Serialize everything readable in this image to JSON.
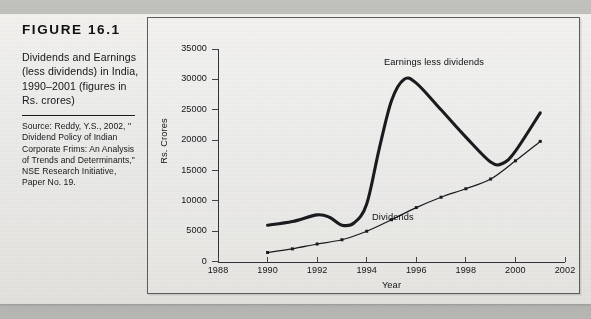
{
  "figure": {
    "label": "FIGURE  16.1",
    "title": "Dividends and Earnings (less dividends) in India, 1990–2001 (figures in Rs. crores)",
    "source": "Source: Reddy, Y.S., 2002, \" Dividend Policy of Indian Corporate Frims: An Analysis of Trends and Determinants,\" NSE Research Initiative, Paper No. 19."
  },
  "chart_data": {
    "type": "line",
    "title": "",
    "xlabel": "Year",
    "ylabel": "Rs. Crores",
    "xlim": [
      1988,
      2002
    ],
    "ylim": [
      0,
      35000
    ],
    "xticks": [
      1988,
      1990,
      1992,
      1994,
      1996,
      1998,
      2000,
      2002
    ],
    "yticks": [
      0,
      5000,
      10000,
      15000,
      20000,
      25000,
      30000,
      35000
    ],
    "grid": false,
    "legend": "inline-annotations",
    "series": [
      {
        "name": "Earnings less dividends",
        "style": "thick-line",
        "markers": false,
        "x": [
          1990,
          1991,
          1992,
          1992.5,
          1993,
          1993.5,
          1994,
          1994.5,
          1995,
          1995.5,
          1996,
          1997,
          1998,
          1999,
          1999.5,
          2000,
          2001
        ],
        "values": [
          6000,
          6600,
          7700,
          7300,
          6000,
          6400,
          9500,
          18500,
          26500,
          30000,
          29400,
          25000,
          20500,
          16400,
          16200,
          18200,
          24500
        ]
      },
      {
        "name": "Dividends",
        "style": "thin-line",
        "markers": true,
        "x": [
          1990,
          1991,
          1992,
          1993,
          1994,
          1995,
          1996,
          1997,
          1998,
          1999,
          2000,
          2001
        ],
        "values": [
          1500,
          2100,
          2900,
          3600,
          5000,
          6900,
          8900,
          10600,
          12000,
          13600,
          16600,
          19800
        ]
      }
    ],
    "annotations": [
      {
        "text": "Earnings less dividends",
        "x": 1996.2,
        "y": 31500
      },
      {
        "text": "Dividends",
        "x": 1995.6,
        "y": 8200
      }
    ]
  }
}
